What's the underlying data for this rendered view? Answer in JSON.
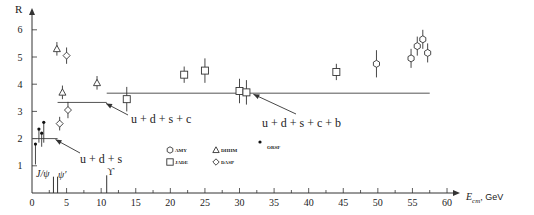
{
  "chart_data": {
    "type": "scatter",
    "title": "",
    "xlabel": "E_cm, GeV",
    "ylabel": "R",
    "xlim": [
      0,
      62
    ],
    "ylim": [
      0,
      6.6
    ],
    "grid": false,
    "x_ticks_major": [
      0,
      5,
      10,
      15,
      20,
      25,
      30,
      35,
      40,
      45,
      50,
      55,
      60
    ],
    "x_tick_labels": [
      "0",
      "5",
      "10",
      "15",
      "20",
      "25",
      "30",
      "35",
      "40",
      "45",
      "50",
      "55",
      "60"
    ],
    "y_ticks_major": [
      1,
      2,
      3,
      4,
      5,
      6
    ],
    "y_tick_labels": [
      "1",
      "2",
      "3",
      "4",
      "5",
      "6"
    ],
    "legend": {
      "position": "inside-bottom-center",
      "entries": [
        {
          "name": "AMY",
          "marker": "hexagon"
        },
        {
          "name": "DHHM",
          "marker": "triangle"
        },
        {
          "name": "JADE",
          "marker": "square"
        },
        {
          "name": "DASP",
          "marker": "diamond"
        },
        {
          "name": "ORSF",
          "marker": "dot"
        }
      ]
    },
    "series": [
      {
        "name": "DHHM",
        "marker": "triangle",
        "points": [
          {
            "x": 3.6,
            "y": 5.3,
            "err": 0.25
          },
          {
            "x": 4.4,
            "y": 3.7,
            "err": 0.25
          },
          {
            "x": 9.4,
            "y": 4.05,
            "err": 0.25
          }
        ]
      },
      {
        "name": "DASP",
        "marker": "diamond",
        "points": [
          {
            "x": 4.0,
            "y": 2.55,
            "err": 0.25
          },
          {
            "x": 5.0,
            "y": 5.05,
            "err": 0.3
          },
          {
            "x": 5.2,
            "y": 3.05,
            "err": 0.3
          }
        ]
      },
      {
        "name": "JADE",
        "marker": "square",
        "points": [
          {
            "x": 13.7,
            "y": 3.45,
            "err": 0.45
          },
          {
            "x": 22.0,
            "y": 4.35,
            "err": 0.3
          },
          {
            "x": 25.0,
            "y": 4.5,
            "err": 0.45
          },
          {
            "x": 30.0,
            "y": 3.75,
            "err": 0.45
          },
          {
            "x": 31.0,
            "y": 3.7,
            "err": 0.45
          },
          {
            "x": 44.0,
            "y": 4.45,
            "err": 0.3
          }
        ]
      },
      {
        "name": "AMY",
        "marker": "hexagon",
        "points": [
          {
            "x": 49.8,
            "y": 4.75,
            "err": 0.5
          },
          {
            "x": 54.8,
            "y": 4.95,
            "err": 0.35
          },
          {
            "x": 55.7,
            "y": 5.4,
            "err": 0.35
          },
          {
            "x": 56.5,
            "y": 5.65,
            "err": 0.35
          },
          {
            "x": 57.2,
            "y": 5.15,
            "err": 0.35
          }
        ]
      },
      {
        "name": "ORSF",
        "marker": "dot",
        "points": [
          {
            "x": 0.5,
            "y": 1.8,
            "err_low": 0.75,
            "err_high": 0.0
          },
          {
            "x": 1.0,
            "y": 2.35,
            "err_low": 0.5,
            "err_high": 0.0
          },
          {
            "x": 1.4,
            "y": 2.2,
            "err_low": 0.5,
            "err_high": 0.0
          },
          {
            "x": 1.7,
            "y": 2.6,
            "err_low": 0.75,
            "err_high": 0.0
          }
        ]
      }
    ],
    "theory_lines": [
      {
        "label": "u+d+s",
        "x_start": 0,
        "x_end": 3.7,
        "y": 2.0
      },
      {
        "label": "u+d+s+c",
        "x_start": 3.7,
        "x_end": 10.8,
        "y": 3.33
      },
      {
        "label": "u+d+s+c+b",
        "x_start": 10.8,
        "x_end": 57.5,
        "y": 3.67
      }
    ],
    "resonances": [
      {
        "label": "J/ψ",
        "x": 3.1,
        "height": 0.6
      },
      {
        "label": "ψ'",
        "x": 3.7,
        "height": 0.6
      },
      {
        "label": "ϒ",
        "x": 10.8,
        "height": 0.65
      }
    ],
    "annotations": [
      {
        "text": "u+d+s",
        "points_to": {
          "x": 3.3,
          "y": 2.0
        }
      },
      {
        "text": "u+d+s+c",
        "points_to": {
          "x": 10.8,
          "y": 3.33
        }
      },
      {
        "text": "u+d+s+c+b",
        "points_to": {
          "x": 32.0,
          "y": 3.67
        }
      }
    ]
  },
  "labels": {
    "y_axis": "R",
    "x_axis_main": "E",
    "x_axis_sub": "cm",
    "x_axis_unit": ", GeV",
    "annot_uds": "u + d + s",
    "annot_udsc": "u + d + s + c",
    "annot_udscb": "u + d + s + c + b",
    "res_jpsi": "J/ψ",
    "res_psiprime": "ψ′",
    "res_upsilon": "ϒ",
    "legend_amy": "AMY",
    "legend_dhhm": "DHHM",
    "legend_jade": "JADE",
    "legend_dasp": "DASP",
    "legend_orsf": "ORSF"
  }
}
